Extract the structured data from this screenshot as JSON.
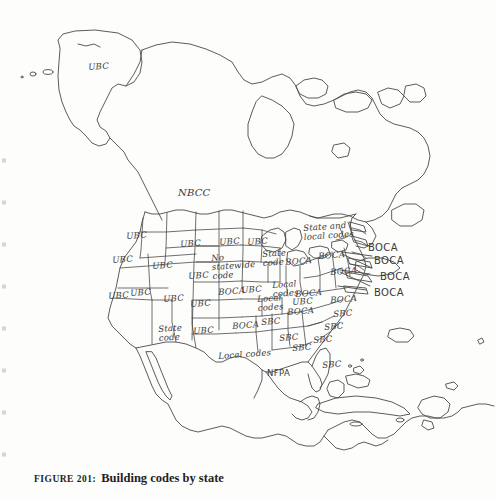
{
  "figure": {
    "number_label": "FIGURE 201:",
    "title": "Building codes by state"
  },
  "map": {
    "name": "north-america-building-codes-map",
    "stroke_color": "#4a4a4a",
    "background_color": "#fdfdfc",
    "label_color": "#3a3a3a"
  },
  "labels": [
    {
      "id": "alaska-ubc",
      "text": "UBC",
      "x": 88,
      "y": 63,
      "style": "tilt"
    },
    {
      "id": "canada-nbcc",
      "text": "NBCC",
      "x": 178,
      "y": 188,
      "style": "big"
    },
    {
      "id": "washington-ubc",
      "text": "UBC",
      "x": 126,
      "y": 232,
      "style": "tilt"
    },
    {
      "id": "oregon-ubc",
      "text": "UBC",
      "x": 112,
      "y": 256,
      "style": "tilt"
    },
    {
      "id": "idaho-ubc",
      "text": "UBC",
      "x": 152,
      "y": 262,
      "style": "tilt"
    },
    {
      "id": "montana-ubc",
      "text": "UBC",
      "x": 180,
      "y": 240,
      "style": "tilt"
    },
    {
      "id": "wyoming-ubc",
      "text": "UBC",
      "x": 188,
      "y": 272,
      "style": "tilt"
    },
    {
      "id": "nevada-ubc",
      "text": "UBC",
      "x": 130,
      "y": 289,
      "style": "tilt"
    },
    {
      "id": "california-ubc",
      "text": "UBC",
      "x": 108,
      "y": 292,
      "style": "tilt"
    },
    {
      "id": "utah-ubc",
      "text": "UBC",
      "x": 163,
      "y": 295,
      "style": "tilt"
    },
    {
      "id": "colorado-ubc",
      "text": "UBC",
      "x": 190,
      "y": 300,
      "style": "tilt"
    },
    {
      "id": "arizona-state-code",
      "text": "State\ncode",
      "x": 158,
      "y": 325,
      "style": "tilt"
    },
    {
      "id": "newmexico-ubc",
      "text": "UBC",
      "x": 193,
      "y": 327,
      "style": "tilt"
    },
    {
      "id": "northdakota-ubc",
      "text": "UBC",
      "x": 219,
      "y": 238,
      "style": "tilt"
    },
    {
      "id": "nebraska-no-statewide",
      "text": "No\nstatewide\ncode",
      "x": 211,
      "y": 254,
      "style": "tilt"
    },
    {
      "id": "minnesota-ubc",
      "text": "UBC",
      "x": 247,
      "y": 238,
      "style": "tilt"
    },
    {
      "id": "kansas-boca",
      "text": "BOCA",
      "x": 218,
      "y": 288,
      "style": "tilt"
    },
    {
      "id": "oklahoma-boca",
      "text": "BOCA",
      "x": 232,
      "y": 322,
      "style": "tilt"
    },
    {
      "id": "missouri-ubc",
      "text": "UBC",
      "x": 241,
      "y": 286,
      "style": "tilt"
    },
    {
      "id": "wisconsin-state-code",
      "text": "State\ncode",
      "x": 262,
      "y": 250,
      "style": "tilt"
    },
    {
      "id": "iowa-boca",
      "text": "BOCA",
      "x": 285,
      "y": 258,
      "style": "tilt"
    },
    {
      "id": "illinois-local-codes",
      "text": "Local\ncodes",
      "x": 272,
      "y": 281,
      "style": "tilt"
    },
    {
      "id": "indiana-boca",
      "text": "BOCA",
      "x": 295,
      "y": 290,
      "style": "tilt"
    },
    {
      "id": "kentucky-local-codes",
      "text": "Local\ncodes",
      "x": 257,
      "y": 295,
      "style": "tilt"
    },
    {
      "id": "tennessee-ubc",
      "text": "UBC",
      "x": 292,
      "y": 298,
      "style": "tilt"
    },
    {
      "id": "texas-local-codes",
      "text": "Local codes",
      "x": 218,
      "y": 352,
      "style": "tilt"
    },
    {
      "id": "louisiana-nfpa",
      "text": "NFPA",
      "x": 267,
      "y": 369,
      "style": "sans"
    },
    {
      "id": "northeast-state-local",
      "text": "State and\nlocal codes",
      "x": 303,
      "y": 224,
      "style": "tilt"
    },
    {
      "id": "boca-leader-1",
      "text": "BOCA",
      "x": 368,
      "y": 243,
      "style": "sans big"
    },
    {
      "id": "boca-leader-2",
      "text": "BOCA",
      "x": 374,
      "y": 256,
      "style": "sans big"
    },
    {
      "id": "boca-leader-3",
      "text": "BOCA",
      "x": 380,
      "y": 272,
      "style": "sans big"
    },
    {
      "id": "boca-leader-4",
      "text": "BOCA",
      "x": 374,
      "y": 288,
      "style": "sans big"
    },
    {
      "id": "ohio-boca",
      "text": "BOCA",
      "x": 318,
      "y": 252,
      "style": "tilt"
    },
    {
      "id": "pennsylvania-boca",
      "text": "BOCA",
      "x": 330,
      "y": 268,
      "style": "tilt"
    },
    {
      "id": "virginia-boca",
      "text": "BOCA",
      "x": 330,
      "y": 296,
      "style": "tilt"
    },
    {
      "id": "carolina-boca",
      "text": "BOCA",
      "x": 287,
      "y": 308,
      "style": "tilt"
    },
    {
      "id": "ncarolina-sbc",
      "text": "SBC",
      "x": 333,
      "y": 310,
      "style": "tilt"
    },
    {
      "id": "scarolina-sbc",
      "text": "SBC",
      "x": 324,
      "y": 323,
      "style": "tilt"
    },
    {
      "id": "arkansas-sbc",
      "text": "SBC",
      "x": 261,
      "y": 318,
      "style": "tilt"
    },
    {
      "id": "mississippi-sbc",
      "text": "SBC",
      "x": 279,
      "y": 334,
      "style": "tilt"
    },
    {
      "id": "alabama-sbc",
      "text": "SBC",
      "x": 292,
      "y": 344,
      "style": "tilt"
    },
    {
      "id": "georgia-sbc",
      "text": "SBC",
      "x": 313,
      "y": 336,
      "style": "tilt"
    },
    {
      "id": "florida-sbc",
      "text": "SBC",
      "x": 322,
      "y": 361,
      "style": "tilt"
    }
  ]
}
